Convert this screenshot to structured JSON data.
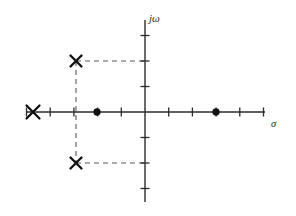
{
  "figure": {
    "width": 296,
    "height": 216,
    "background": "#ffffff",
    "ink_color": "#111111",
    "axis_color": "#2b2b2b",
    "dash_color": "#5a5a5a"
  },
  "axes": {
    "real": {
      "label": "σ",
      "label_name": "sigma",
      "orientation": "horizontal",
      "origin_px": {
        "x": 145,
        "y": 112
      },
      "start_px": 26,
      "end_px": 265,
      "unit_px": 23.7,
      "tick_len_px": 9,
      "tick_values": [
        -5,
        -4,
        -3,
        -2,
        -1,
        1,
        2,
        3,
        4,
        5
      ],
      "range": [
        -5.0,
        5.0
      ]
    },
    "imag": {
      "label": "jω",
      "label_name": "j-omega",
      "orientation": "vertical",
      "origin_px": {
        "x": 145,
        "y": 112
      },
      "start_px": 20,
      "end_px": 202,
      "unit_px": 25.5,
      "tick_len_px": 9,
      "tick_values": [
        -3,
        -2,
        -1,
        1,
        2,
        3
      ],
      "range": [
        -3.6,
        3.6
      ]
    }
  },
  "chart_data": {
    "type": "scatter",
    "xlabel": "σ",
    "ylabel": "jω",
    "xlim": [
      -5.0,
      5.0
    ],
    "ylim": [
      -3.6,
      3.6
    ],
    "grid": false,
    "legend": "none",
    "series": [
      {
        "name": "poles",
        "marker": "x",
        "points": [
          {
            "label": "real pole",
            "sigma": -4.7,
            "omega": 0,
            "px": {
              "x": 33,
              "y": 112
            },
            "size": 13
          },
          {
            "label": "complex pole (upper)",
            "sigma": -2.9,
            "omega": 2.0,
            "px": {
              "x": 76,
              "y": 61
            },
            "size": 11
          },
          {
            "label": "complex pole (lower)",
            "sigma": -2.9,
            "omega": -2.0,
            "px": {
              "x": 76,
              "y": 163
            },
            "size": 11
          }
        ]
      },
      {
        "name": "zeros",
        "marker": "filled-circle",
        "points": [
          {
            "label": "left zero",
            "sigma": -2.0,
            "omega": 0,
            "px": {
              "x": 97,
              "y": 112
            },
            "radius": 3.4
          },
          {
            "label": "right zero",
            "sigma": 3.0,
            "omega": 0,
            "px": {
              "x": 216,
              "y": 112
            },
            "radius": 3.4
          }
        ]
      }
    ],
    "annotations": [
      {
        "name": "projection-upper-horizontal",
        "style": "dashed",
        "from_px": {
          "x": 76,
          "y": 61
        },
        "to_px": {
          "x": 145,
          "y": 61
        }
      },
      {
        "name": "projection-lower-horizontal",
        "style": "dashed",
        "from_px": {
          "x": 76,
          "y": 163
        },
        "to_px": {
          "x": 145,
          "y": 163
        }
      },
      {
        "name": "projection-vertical",
        "style": "dashed",
        "from_px": {
          "x": 76,
          "y": 61
        },
        "to_px": {
          "x": 76,
          "y": 163
        }
      }
    ]
  }
}
